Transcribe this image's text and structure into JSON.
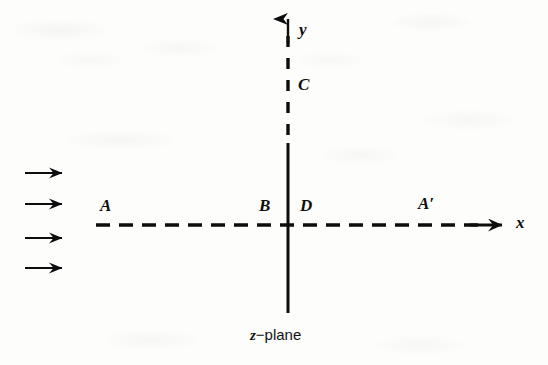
{
  "figure": {
    "name": "z-plane-complex-flow-diagram",
    "background_color": "#fdfdfc",
    "ink_color": "#0d0d0d",
    "width": 548,
    "height": 365,
    "caption_symbol": "z",
    "caption_text": "−plane"
  },
  "axes": {
    "x": {
      "label": "x",
      "style": "dashed-with-arrow",
      "origin_x": 288,
      "y": 225,
      "start_x": 96,
      "arrow_tip_x": 502
    },
    "y": {
      "label": "y",
      "style": "solid-below-origin-dashed-above",
      "x": 288,
      "arrow_tip_y": 18,
      "dash_end_y": 143,
      "bottom_y": 313
    }
  },
  "points": [
    {
      "id": "A",
      "label": "A",
      "x": 105,
      "y": 207
    },
    {
      "id": "B",
      "label": "B",
      "x": 264,
      "y": 207
    },
    {
      "id": "C",
      "label": "C",
      "x": 303,
      "y": 86
    },
    {
      "id": "D",
      "label": "D",
      "x": 305,
      "y": 207
    },
    {
      "id": "Ap",
      "label": "A′",
      "x": 425,
      "y": 205
    }
  ],
  "axis_labels": [
    {
      "id": "y-axis-label",
      "label": "y",
      "x": 303,
      "y": 30
    },
    {
      "id": "x-axis-label",
      "label": "x",
      "x": 519,
      "y": 221
    }
  ],
  "flow_arrows": {
    "name": "uniform-flow-arrows",
    "count": 4,
    "direction": "right",
    "x_start": 25,
    "x_end": 65,
    "ys": [
      173,
      204,
      238,
      268
    ]
  },
  "dash_pattern": {
    "x_axis": "14 9",
    "y_axis": "11 11"
  }
}
